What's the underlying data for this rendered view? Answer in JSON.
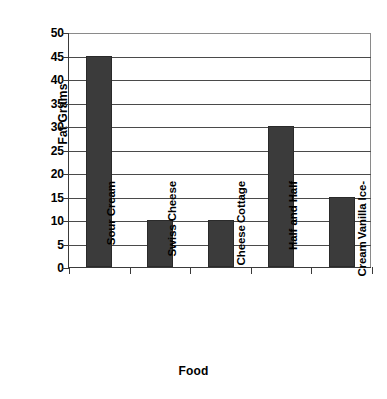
{
  "chart_data": {
    "type": "bar",
    "title": "",
    "subtitle": "",
    "xlabel": "Food",
    "ylabel": "Fat Grams",
    "categories": [
      "Sour Cream",
      "Swiss Cheese",
      "Cottage Cheese",
      "Half and Half",
      "Vanilla Ice-Cream"
    ],
    "category_lines": [
      [
        "Sour Cream"
      ],
      [
        "Swiss Cheese"
      ],
      [
        "Cottage",
        "Cheese"
      ],
      [
        "Half and Half"
      ],
      [
        "Vanilla Ice-",
        "Cream"
      ]
    ],
    "values": [
      45,
      10,
      10,
      30,
      15
    ],
    "ylim": [
      0,
      50
    ],
    "ytick_step": 5,
    "yticks": [
      0,
      5,
      10,
      15,
      20,
      25,
      30,
      35,
      40,
      45,
      50
    ],
    "ytick_labels": [
      "0",
      "5",
      "10",
      "15",
      "20",
      "25",
      "30",
      "35",
      "40",
      "45",
      "50"
    ],
    "grid": true,
    "grid_axis": "y",
    "legend": false,
    "legend_position": "none",
    "bar_color": "#3b3b3b",
    "bar_edge_color": "#2a2a2a",
    "axis_color": "#3a3a3a",
    "grid_color": "#4a4a4a",
    "background_color": "#ffffff",
    "series": [
      {
        "name": "Fat Grams",
        "values": [
          45,
          10,
          10,
          30,
          15
        ]
      }
    ]
  }
}
